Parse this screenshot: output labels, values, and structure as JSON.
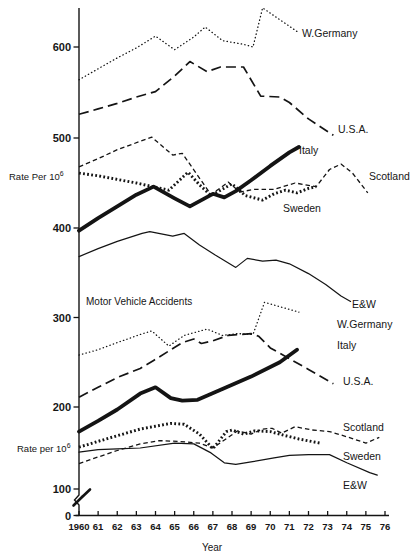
{
  "chart_data": {
    "type": "line",
    "title": "Motor Vehicle Accidents",
    "xlabel": "Year",
    "ylabel": "Rate Per 10^6",
    "x_ticks": [
      {
        "year": 1960,
        "label": "1960"
      },
      {
        "year": 1961,
        "label": "61"
      },
      {
        "year": 1962,
        "label": "62"
      },
      {
        "year": 1963,
        "label": "63"
      },
      {
        "year": 1964,
        "label": "64"
      },
      {
        "year": 1965,
        "label": "65"
      },
      {
        "year": 1966,
        "label": "66"
      },
      {
        "year": 1967,
        "label": "67"
      },
      {
        "year": 1968,
        "label": "68"
      },
      {
        "year": 1969,
        "label": "69"
      },
      {
        "year": 1970,
        "label": "70"
      },
      {
        "year": 1971,
        "label": "71"
      },
      {
        "year": 1972,
        "label": "72"
      },
      {
        "year": 1973,
        "label": "73"
      },
      {
        "year": 1974,
        "label": "74"
      },
      {
        "year": 1975,
        "label": "75"
      },
      {
        "year": 1976,
        "label": "76"
      }
    ],
    "y_ticks": [
      0,
      100,
      200,
      300,
      400,
      500,
      600
    ],
    "axis_break_between": [
      0,
      100
    ],
    "grid": false,
    "legend_position": "inline-right-of-lines",
    "y_unit_labels": [
      {
        "text": "Rate Per 10",
        "exp": "6",
        "x": 9,
        "y": 180
      },
      {
        "text": "Rate per 10",
        "exp": "6",
        "x": 17,
        "y": 452
      }
    ],
    "ink_color": "#141414",
    "groups": [
      {
        "id": "upper",
        "series": [
          {
            "id": "w-germany",
            "name": "W.Germany",
            "style": "dot-fine",
            "label": {
              "text": "W.Germany",
              "x": 302,
              "y": 37
            },
            "points": [
              [
                1960,
                564
              ],
              [
                1961,
                576
              ],
              [
                1962,
                588
              ],
              [
                1963,
                599
              ],
              [
                1964,
                612
              ],
              [
                1965,
                597
              ],
              [
                1966,
                611
              ],
              [
                1966.6,
                622
              ],
              [
                1967.5,
                607
              ],
              [
                1968.6,
                603
              ],
              [
                1969.1,
                600
              ],
              [
                1969.6,
                643
              ],
              [
                1971.4,
                617
              ]
            ]
          },
          {
            "id": "usa",
            "name": "U.S.A.",
            "style": "dash-long",
            "label": {
              "text": "U.S.A.",
              "x": 338,
              "y": 133
            },
            "points": [
              [
                1960,
                526
              ],
              [
                1961,
                532
              ],
              [
                1962,
                538
              ],
              [
                1963,
                545
              ],
              [
                1964,
                551
              ],
              [
                1965,
                568
              ],
              [
                1965.8,
                584
              ],
              [
                1966.7,
                573
              ],
              [
                1967.4,
                578
              ],
              [
                1968.6,
                578
              ],
              [
                1969.5,
                546
              ],
              [
                1970.5,
                545
              ],
              [
                1971,
                539
              ],
              [
                1972,
                521
              ],
              [
                1973.3,
                503
              ]
            ]
          },
          {
            "id": "italy",
            "name": "Italy",
            "style": "solid-thick",
            "label": {
              "text": "Italy",
              "x": 299,
              "y": 154
            },
            "points": [
              [
                1960,
                397
              ],
              [
                1961,
                411
              ],
              [
                1962,
                424
              ],
              [
                1963,
                437
              ],
              [
                1963.9,
                446
              ],
              [
                1965,
                433
              ],
              [
                1965.8,
                424
              ],
              [
                1966.5,
                432
              ],
              [
                1967,
                438
              ],
              [
                1967.6,
                434
              ],
              [
                1968.2,
                441
              ],
              [
                1969,
                453
              ],
              [
                1970,
                469
              ],
              [
                1971,
                484
              ],
              [
                1971.5,
                490
              ]
            ]
          },
          {
            "id": "scotland",
            "name": "Scotland",
            "style": "dash-short",
            "label": {
              "text": "Scotland",
              "x": 369,
              "y": 180
            },
            "points": [
              [
                1960,
                468
              ],
              [
                1961,
                477
              ],
              [
                1962,
                487
              ],
              [
                1963.8,
                501
              ],
              [
                1964.9,
                481
              ],
              [
                1965.4,
                483
              ],
              [
                1966.9,
                437
              ],
              [
                1967.8,
                451
              ],
              [
                1968.4,
                440
              ],
              [
                1969.2,
                443
              ],
              [
                1970.2,
                443
              ],
              [
                1971.3,
                450
              ],
              [
                1972.4,
                446
              ],
              [
                1973.1,
                465
              ],
              [
                1973.7,
                471
              ],
              [
                1974.3,
                461
              ],
              [
                1975.1,
                439
              ]
            ]
          },
          {
            "id": "sweden",
            "name": "Sweden",
            "style": "dot-bold",
            "label": {
              "text": "Sweden",
              "x": 283,
              "y": 212
            },
            "points": [
              [
                1960,
                461
              ],
              [
                1961,
                458
              ],
              [
                1962,
                454
              ],
              [
                1963,
                450
              ],
              [
                1964.7,
                442
              ],
              [
                1965.7,
                462
              ],
              [
                1966.3,
                448
              ],
              [
                1966.9,
                436
              ],
              [
                1968,
                449
              ],
              [
                1968.7,
                436
              ],
              [
                1969.6,
                431
              ],
              [
                1970.2,
                438
              ],
              [
                1970.8,
                442
              ],
              [
                1971.4,
                439
              ],
              [
                1972,
                444
              ],
              [
                1972.4,
                446
              ]
            ]
          },
          {
            "id": "ew",
            "name": "E&W",
            "style": "solid-thin",
            "label": {
              "text": "E&W",
              "x": 352,
              "y": 308
            },
            "points": [
              [
                1960,
                368
              ],
              [
                1961,
                377
              ],
              [
                1962,
                385
              ],
              [
                1963.3,
                394
              ],
              [
                1963.7,
                396
              ],
              [
                1964.9,
                391
              ],
              [
                1965.5,
                394
              ],
              [
                1966.3,
                381
              ],
              [
                1967.1,
                370
              ],
              [
                1968.2,
                356
              ],
              [
                1968.8,
                366
              ],
              [
                1969.6,
                363
              ],
              [
                1970.3,
                364
              ],
              [
                1971,
                360
              ],
              [
                1972,
                349
              ],
              [
                1972.9,
                337
              ],
              [
                1973.7,
                324
              ],
              [
                1974.2,
                318
              ]
            ]
          }
        ]
      },
      {
        "id": "lower",
        "series": [
          {
            "id": "w-germany",
            "name": "W.Germany",
            "style": "dot-fine",
            "label": {
              "text": "W.Germany",
              "x": 337,
              "y": 328
            },
            "points": [
              [
                1960,
                258
              ],
              [
                1961,
                264
              ],
              [
                1962,
                272
              ],
              [
                1963.2,
                281
              ],
              [
                1963.8,
                285
              ],
              [
                1964.7,
                268
              ],
              [
                1965.5,
                280
              ],
              [
                1966.7,
                287
              ],
              [
                1967.5,
                280
              ],
              [
                1968.3,
                282
              ],
              [
                1969.1,
                281
              ],
              [
                1969.7,
                317
              ],
              [
                1971.5,
                306
              ]
            ]
          },
          {
            "id": "usa",
            "name": "U.S.A.",
            "style": "dash-long",
            "label": {
              "text": "U.S.A.",
              "x": 343,
              "y": 385
            },
            "points": [
              [
                1960,
                211
              ],
              [
                1961,
                222
              ],
              [
                1962,
                233
              ],
              [
                1963.2,
                243
              ],
              [
                1963.9,
                252
              ],
              [
                1965.4,
                272
              ],
              [
                1966,
                276
              ],
              [
                1966.4,
                271
              ],
              [
                1967,
                274
              ],
              [
                1967.8,
                280
              ],
              [
                1969,
                282
              ],
              [
                1969.4,
                279
              ],
              [
                1970,
                266
              ],
              [
                1971,
                254
              ],
              [
                1972,
                242
              ],
              [
                1973.3,
                226
              ]
            ]
          },
          {
            "id": "italy",
            "name": "Italy",
            "style": "solid-thick",
            "label": {
              "text": "Italy",
              "x": 337,
              "y": 349
            },
            "points": [
              [
                1960,
                170
              ],
              [
                1961,
                183
              ],
              [
                1962,
                197
              ],
              [
                1963.2,
                215
              ],
              [
                1964,
                222
              ],
              [
                1964.8,
                210
              ],
              [
                1965.4,
                207
              ],
              [
                1966.2,
                208
              ],
              [
                1967.5,
                220
              ],
              [
                1969,
                234
              ],
              [
                1970.5,
                250
              ],
              [
                1971.4,
                264
              ]
            ]
          },
          {
            "id": "scotland",
            "name": "Scotland",
            "style": "dash-short",
            "label": {
              "text": "Scotland",
              "x": 343,
              "y": 431
            },
            "points": [
              [
                1960,
                131
              ],
              [
                1961,
                139
              ],
              [
                1962,
                147
              ],
              [
                1963.2,
                155
              ],
              [
                1964.2,
                159
              ],
              [
                1965.2,
                158
              ],
              [
                1966.3,
                156
              ],
              [
                1967,
                150
              ],
              [
                1968.3,
                171
              ],
              [
                1969,
                167
              ],
              [
                1969.6,
                173
              ],
              [
                1970.1,
                174
              ],
              [
                1970.6,
                168
              ],
              [
                1971.3,
                176
              ],
              [
                1972.2,
                172
              ],
              [
                1973.1,
                170
              ],
              [
                1974.1,
                163
              ],
              [
                1975,
                156
              ],
              [
                1975.7,
                163
              ]
            ]
          },
          {
            "id": "sweden",
            "name": "Sweden",
            "style": "dot-bold",
            "label": {
              "text": "Sweden",
              "x": 343,
              "y": 460
            },
            "points": [
              [
                1960,
                151
              ],
              [
                1961,
                158
              ],
              [
                1962,
                165
              ],
              [
                1963.2,
                173
              ],
              [
                1964.8,
                180
              ],
              [
                1965.5,
                179
              ],
              [
                1966.3,
                167
              ],
              [
                1967,
                149
              ],
              [
                1967.7,
                170
              ],
              [
                1968,
                172
              ],
              [
                1968.6,
                167
              ],
              [
                1969.2,
                171
              ],
              [
                1970,
                170
              ],
              [
                1970.8,
                165
              ],
              [
                1971.5,
                161
              ],
              [
                1972.6,
                156
              ]
            ]
          },
          {
            "id": "ew",
            "name": "E&W",
            "style": "solid-thin",
            "label": {
              "text": "E&W",
              "x": 343,
              "y": 489
            },
            "points": [
              [
                1960,
                145
              ],
              [
                1961,
                148
              ],
              [
                1962,
                149
              ],
              [
                1963.2,
                150
              ],
              [
                1965,
                156
              ],
              [
                1966,
                155
              ],
              [
                1966.9,
                144
              ],
              [
                1967.6,
                132
              ],
              [
                1968.2,
                130
              ],
              [
                1969,
                133
              ],
              [
                1970.2,
                138
              ],
              [
                1971,
                141
              ],
              [
                1972,
                142
              ],
              [
                1973.1,
                142
              ],
              [
                1974,
                132
              ],
              [
                1975.2,
                120
              ],
              [
                1975.6,
                117
              ]
            ]
          }
        ]
      }
    ]
  }
}
